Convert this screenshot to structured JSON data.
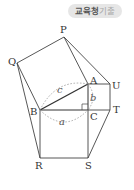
{
  "badge": {
    "strong_text": "교육청",
    "weak_text": "기출"
  },
  "diagram": {
    "points": {
      "P": "P",
      "Q": "Q",
      "A": "A",
      "U": "U",
      "B": "B",
      "C": "C",
      "T": "T",
      "R": "R",
      "S": "S"
    },
    "sides": {
      "a": "a",
      "b": "b",
      "c": "c"
    },
    "colors": {
      "line": "#444444",
      "dashed_arc": "#999999",
      "badge_bg": "#e6e6e6"
    }
  }
}
